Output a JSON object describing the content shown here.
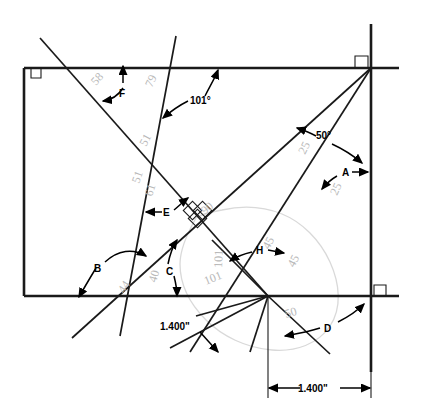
{
  "figure": {
    "units": "inches",
    "line_color": "#1a1a1a",
    "annotation_color": "#000000",
    "faint_color": "#b9b9b9",
    "blob_color": "#d9d9d9"
  },
  "labels": {
    "A": "A",
    "B": "B",
    "C": "C",
    "D": "D",
    "E": "E",
    "F": "F",
    "H": "H"
  },
  "angles": {
    "deg_101": "101°",
    "deg_50": "50°"
  },
  "faint_values": {
    "v58": "58",
    "v79": "79",
    "v51_upper": "51",
    "v51_lower": "51",
    "v61": "61",
    "v25_upper": "25",
    "v25_lower": "25",
    "v90": "90",
    "v44": "44",
    "v40": "40",
    "v101_rot": "101",
    "v45_upper": "45",
    "v45_lower": "45",
    "v50_lower": "50",
    "v101_left": "101"
  },
  "dimensions": {
    "d1": "1.400\"",
    "d2": "1.400\""
  }
}
